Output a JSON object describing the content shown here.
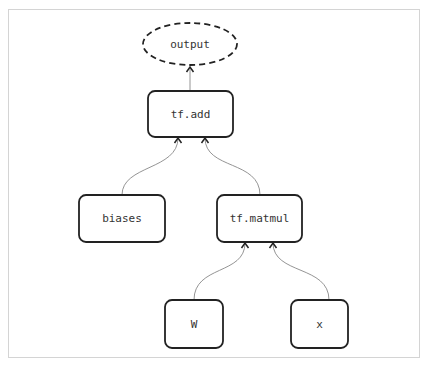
{
  "diagram": {
    "type": "tensorflow-computation-graph",
    "nodes": [
      {
        "id": "output",
        "label": "output",
        "shape": "dashed-ellipse"
      },
      {
        "id": "add",
        "label": "tf.add",
        "shape": "rounded-rect"
      },
      {
        "id": "biases",
        "label": "biases",
        "shape": "rounded-rect"
      },
      {
        "id": "matmul",
        "label": "tf.matmul",
        "shape": "rounded-rect"
      },
      {
        "id": "W",
        "label": "W",
        "shape": "rounded-rect"
      },
      {
        "id": "x",
        "label": "x",
        "shape": "rounded-rect"
      }
    ],
    "edges": [
      {
        "from": "add",
        "to": "output"
      },
      {
        "from": "biases",
        "to": "add"
      },
      {
        "from": "matmul",
        "to": "add"
      },
      {
        "from": "W",
        "to": "matmul"
      },
      {
        "from": "x",
        "to": "matmul"
      }
    ]
  }
}
